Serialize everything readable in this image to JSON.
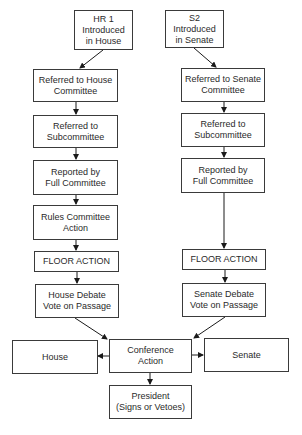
{
  "diagram": {
    "house_column": {
      "start": "HR 1\nIntroduced\nin House",
      "steps": [
        "Referred to House\nCommittee",
        "Referred to\nSubcommittee",
        "Reported by\nFull Committee",
        "Rules Committee\nAction",
        "FLOOR ACTION",
        "House Debate\nVote on Passage"
      ]
    },
    "senate_column": {
      "start": "S2\nIntroduced\nin Senate",
      "steps": [
        "Referred to Senate\nCommittee",
        "Referred to\nSubcommittee",
        "Reported by\nFull Committee",
        "FLOOR ACTION",
        "Senate Debate\nVote on Passage"
      ]
    },
    "conference": {
      "center": "Conference\nAction",
      "left": "House",
      "right": "Senate",
      "final": "President\n(Signs or Vetoes)"
    },
    "colors": {
      "line": "#1a1a1a",
      "border": "#3a3a3a",
      "text": "#2a2a2a"
    }
  }
}
